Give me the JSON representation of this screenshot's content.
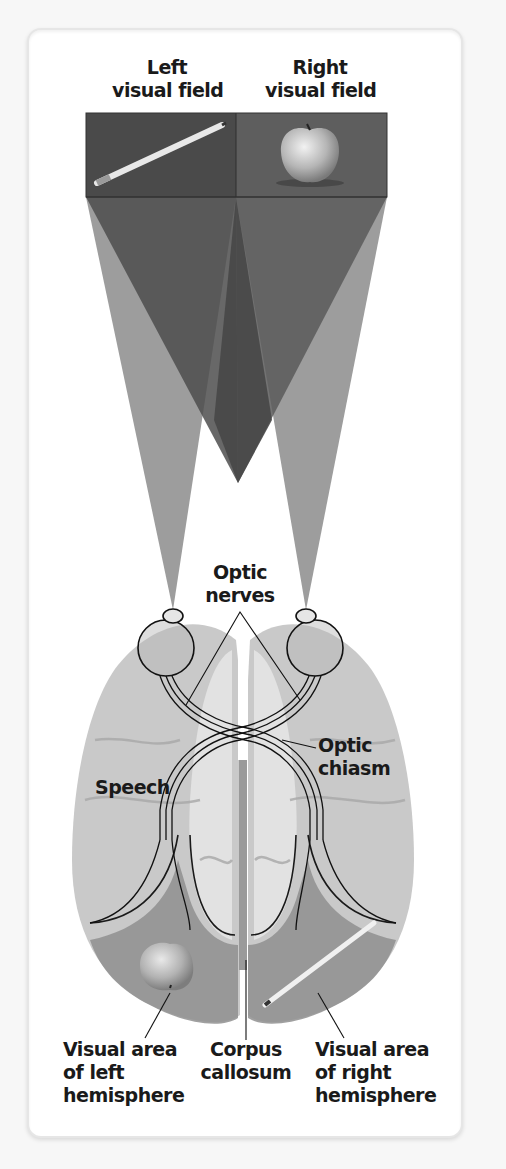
{
  "diagram": {
    "title_labels": {
      "left_field": [
        "Left",
        "visual field"
      ],
      "right_field": [
        "Right",
        "visual field"
      ]
    },
    "objects": {
      "left_field_object": "pencil",
      "right_field_object": "apple",
      "left_hemisphere_projection": "apple",
      "right_hemisphere_projection": "pencil"
    },
    "labels": {
      "optic_nerves": [
        "Optic",
        "nerves"
      ],
      "optic_chiasm": [
        "Optic",
        "chiasm"
      ],
      "speech": "Speech",
      "visual_area_left": [
        "Visual area",
        "of left",
        "hemisphere"
      ],
      "corpus_callosum": [
        "Corpus",
        "callosum"
      ],
      "visual_area_right": [
        "Visual area",
        "of right",
        "hemisphere"
      ]
    },
    "colors": {
      "background": "#f7f7f7",
      "card": "#ffffff",
      "field_box_left": "#4a4a4a",
      "field_box_right": "#5e5e5e",
      "ray_outer": "#9d9d9d",
      "ray_inner": "#505050",
      "brain": "#cfcfcf",
      "visual_area_shade": "#8f8f8f",
      "text": "#1a1a1a"
    }
  }
}
